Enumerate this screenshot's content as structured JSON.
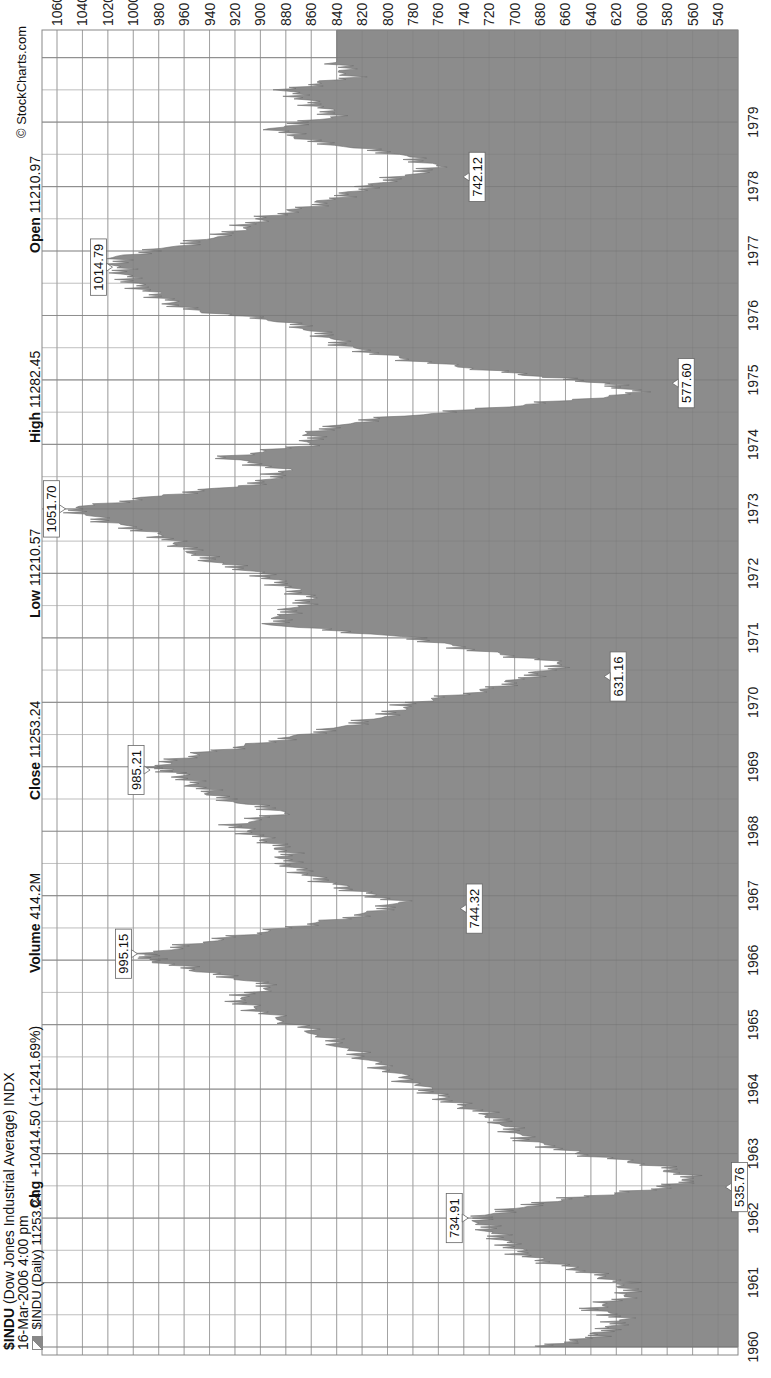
{
  "header": {
    "symbol": "$INDU",
    "name": "(Dow Jones Industrial Average) INDX",
    "date": "16-Mar-2006 4:00 pm",
    "legend_label": "$INDU (Daily) 11253.24",
    "copyright": "© StockCharts.com",
    "stats": [
      {
        "label": "Open",
        "value": "11210.97"
      },
      {
        "label": "High",
        "value": "11282.45"
      },
      {
        "label": "Low",
        "value": "11210.57"
      },
      {
        "label": "Close",
        "value": "11253.24"
      },
      {
        "label": "Volume",
        "value": "414.2M"
      },
      {
        "label": "Chg",
        "value": "+10414.50 (+1241.69%)"
      }
    ]
  },
  "colors": {
    "area_fill": "#8c8c8c",
    "grid": "#9a9a9a",
    "background": "#ffffff",
    "text": "#111111"
  },
  "chart_data": {
    "type": "area",
    "title": "$INDU (Dow Jones Industrial Average) INDX",
    "subtitle": "16-Mar-2006 4:00 pm",
    "xlabel": "",
    "ylabel": "",
    "orientation": "rotated 90° counter-clockwise",
    "x_ticks": [
      "1960",
      "1961",
      "1962",
      "1963",
      "1964",
      "1965",
      "1966",
      "1967",
      "1968",
      "1969",
      "1970",
      "1971",
      "1972",
      "1973",
      "1974",
      "1975",
      "1976",
      "1977",
      "1978",
      "1979"
    ],
    "y_ticks": [
      1060,
      1040,
      1020,
      1000,
      980,
      960,
      940,
      920,
      900,
      880,
      860,
      840,
      820,
      800,
      780,
      760,
      740,
      720,
      700,
      680,
      660,
      640,
      620,
      600,
      580,
      560,
      540
    ],
    "ylim": [
      530,
      1070
    ],
    "grid": true,
    "legend": [
      {
        "name": "$INDU (Daily) 11253.24",
        "position": "top-left"
      }
    ],
    "series": [
      {
        "name": "$INDU (Daily)",
        "x": [
          1960.0,
          1960.15,
          1960.3,
          1960.45,
          1960.6,
          1960.8,
          1961.0,
          1961.2,
          1961.4,
          1961.6,
          1961.8,
          1962.0,
          1962.15,
          1962.3,
          1962.45,
          1962.6,
          1962.8,
          1963.0,
          1963.2,
          1963.4,
          1963.6,
          1963.8,
          1964.0,
          1964.3,
          1964.6,
          1964.9,
          1965.2,
          1965.4,
          1965.6,
          1965.8,
          1966.0,
          1966.1,
          1966.3,
          1966.5,
          1966.7,
          1966.9,
          1967.1,
          1967.3,
          1967.5,
          1967.7,
          1967.9,
          1968.1,
          1968.3,
          1968.5,
          1968.7,
          1968.9,
          1969.0,
          1969.2,
          1969.4,
          1969.6,
          1969.8,
          1970.0,
          1970.2,
          1970.4,
          1970.6,
          1970.8,
          1971.0,
          1971.2,
          1971.4,
          1971.6,
          1971.8,
          1972.0,
          1972.2,
          1972.4,
          1972.6,
          1972.8,
          1973.0,
          1973.2,
          1973.4,
          1973.6,
          1973.8,
          1974.0,
          1974.2,
          1974.4,
          1974.6,
          1974.8,
          1974.95,
          1975.1,
          1975.3,
          1975.5,
          1975.7,
          1975.9,
          1976.1,
          1976.3,
          1976.5,
          1976.7,
          1976.9,
          1977.1,
          1977.3,
          1977.5,
          1977.7,
          1977.9,
          1978.1,
          1978.3,
          1978.5,
          1978.7,
          1978.9,
          1979.1,
          1979.3,
          1979.5,
          1979.7,
          1979.95
        ],
        "values": [
          679,
          640,
          625,
          615,
          640,
          610,
          615,
          650,
          690,
          705,
          720,
          730,
          700,
          660,
          590,
          560,
          585,
          650,
          690,
          705,
          720,
          750,
          770,
          800,
          830,
          860,
          900,
          920,
          890,
          940,
          985,
          990,
          940,
          880,
          820,
          790,
          830,
          860,
          880,
          880,
          900,
          920,
          880,
          930,
          950,
          965,
          985,
          950,
          890,
          840,
          800,
          780,
          720,
          690,
          660,
          730,
          780,
          890,
          880,
          860,
          880,
          900,
          940,
          960,
          980,
          1020,
          1051,
          980,
          900,
          880,
          930,
          860,
          860,
          810,
          700,
          600,
          630,
          700,
          780,
          830,
          850,
          880,
          960,
          980,
          1000,
          1010,
          1014,
          960,
          920,
          900,
          860,
          830,
          800,
          760,
          790,
          860,
          890,
          840,
          860,
          880,
          830,
          840
        ]
      }
    ],
    "annotations": [
      {
        "label": "734.91",
        "x": 1962.0,
        "y": 734.91,
        "type": "high"
      },
      {
        "label": "535.76",
        "x": 1962.48,
        "y": 535.76,
        "type": "low"
      },
      {
        "label": "995.15",
        "x": 1966.1,
        "y": 995.15,
        "type": "high"
      },
      {
        "label": "744.32",
        "x": 1966.8,
        "y": 744.32,
        "type": "low"
      },
      {
        "label": "985.21",
        "x": 1968.95,
        "y": 985.21,
        "type": "high"
      },
      {
        "label": "631.16",
        "x": 1970.4,
        "y": 631.16,
        "type": "low"
      },
      {
        "label": "1051.70",
        "x": 1973.0,
        "y": 1051.7,
        "type": "high"
      },
      {
        "label": "577.60",
        "x": 1974.95,
        "y": 577.6,
        "type": "low"
      },
      {
        "label": "1014.79",
        "x": 1976.75,
        "y": 1014.79,
        "type": "high"
      },
      {
        "label": "742.12",
        "x": 1978.15,
        "y": 742.12,
        "type": "low"
      }
    ]
  }
}
